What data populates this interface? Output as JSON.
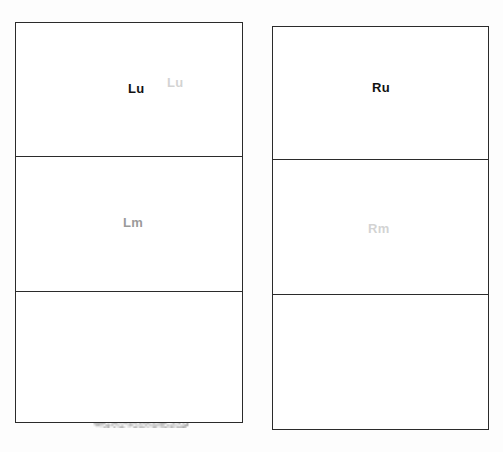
{
  "study": {
    "modality": "renal-scintigraphy",
    "view": "posterior",
    "background_color": "#fdfdfd",
    "frame_color": "#2b2b2b",
    "activity_color": "#000000"
  },
  "panels": [
    {
      "id": "left-kidney",
      "name": "left-kidney-panel",
      "x": 15,
      "y": 22,
      "width": 226,
      "height": 399,
      "dividers": [
        133,
        268
      ],
      "regions": [
        {
          "id": "Lu",
          "label": "Lu",
          "segment": "upper",
          "label_x": 113,
          "label_y": 60,
          "style": "lbl-dark"
        },
        {
          "id": "Lm",
          "label": "Lm",
          "segment": "middle",
          "label_x": 108,
          "label_y": 194,
          "style": "lbl-faint"
        },
        {
          "id": "Ll",
          "label": "",
          "segment": "lower",
          "label_x": 0,
          "label_y": 0,
          "style": "lbl-ghost"
        }
      ],
      "extra_labels": [
        {
          "id": "Lu2",
          "label": "Lu",
          "label_x": 152,
          "label_y": 54,
          "style": "lbl-ghost"
        }
      ],
      "activity": {
        "center_x": 125,
        "center_y": 215,
        "radius_x": 72,
        "radius_y": 185,
        "peak_opacity": 1.0,
        "overflow_top": 34
      }
    },
    {
      "id": "right-kidney",
      "name": "right-kidney-panel",
      "x": 272,
      "y": 26,
      "width": 215,
      "height": 402,
      "dividers": [
        132,
        267
      ],
      "regions": [
        {
          "id": "Ru",
          "label": "Ru",
          "segment": "upper",
          "label_x": 100,
          "label_y": 55,
          "style": "lbl-dark"
        },
        {
          "id": "Rm",
          "label": "Rm",
          "segment": "middle",
          "label_x": 96,
          "label_y": 196,
          "style": "lbl-ghost"
        },
        {
          "id": "Rl",
          "label": "",
          "segment": "lower",
          "label_x": 0,
          "label_y": 0,
          "style": "lbl-ghost"
        }
      ],
      "extra_labels": [],
      "activity": {
        "center_x": 108,
        "center_y": 245,
        "radius_x": 64,
        "radius_y": 150,
        "peak_opacity": 1.0,
        "overflow_top": 0
      }
    }
  ]
}
